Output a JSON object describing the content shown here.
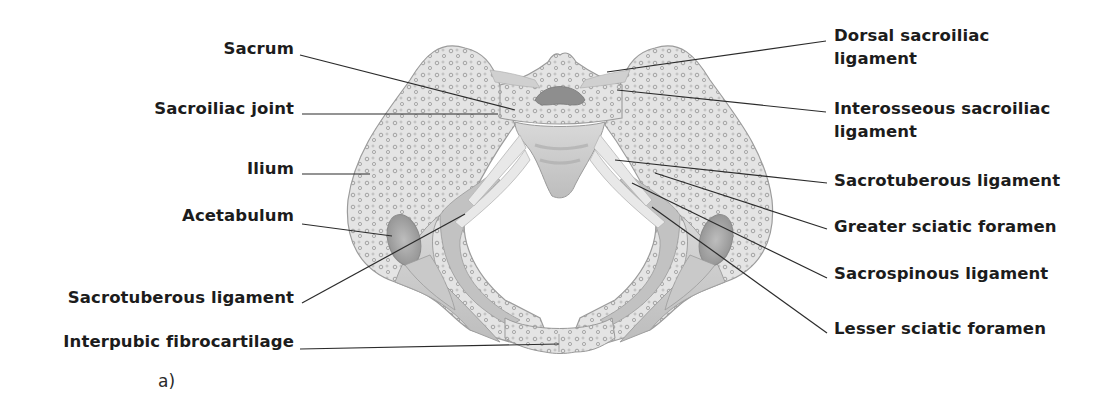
{
  "figure": {
    "panel_label": "a)",
    "colors": {
      "background": "#ffffff",
      "bone_light": "#e2e2e2",
      "bone_mid": "#c4c4c4",
      "bone_dark": "#8e8e8e",
      "ligament": "#d8d8d8",
      "leader_line": "#2b2b2b",
      "text": "#1c1c1c"
    }
  },
  "labels_left": [
    {
      "id": "sacrum",
      "text": "Sacrum",
      "x": 294,
      "y": 37,
      "line": [
        300,
        55,
        515,
        110
      ]
    },
    {
      "id": "sacroiliac-joint",
      "text": "Sacroiliac joint",
      "x": 294,
      "y": 97,
      "line": [
        302,
        114,
        498,
        114
      ]
    },
    {
      "id": "ilium",
      "text": "Ilium",
      "x": 294,
      "y": 157,
      "line": [
        302,
        174,
        370,
        174
      ]
    },
    {
      "id": "acetabulum",
      "text": "Acetabulum",
      "x": 294,
      "y": 204,
      "line": [
        302,
        224,
        392,
        236
      ]
    },
    {
      "id": "sacrotuberous-ligament-left",
      "text": "Sacrotuberous ligament",
      "x": 294,
      "y": 286,
      "line": [
        302,
        303,
        465,
        214
      ]
    },
    {
      "id": "interpubic-fibrocartilage",
      "text": "Interpubic fibrocartilage",
      "x": 294,
      "y": 330,
      "line": [
        300,
        349,
        559,
        344
      ]
    }
  ],
  "labels_right": [
    {
      "id": "dorsal-sacroiliac-ligament",
      "lines": [
        "Dorsal sacroiliac",
        "ligament"
      ],
      "x": 834,
      "y": 24,
      "line": [
        826,
        41,
        607,
        72
      ]
    },
    {
      "id": "interosseous-sacroiliac-ligament",
      "lines": [
        "Interosseous sacroiliac",
        "ligament"
      ],
      "x": 834,
      "y": 97,
      "line": [
        826,
        112,
        617,
        90
      ]
    },
    {
      "id": "sacrotuberous-ligament-right",
      "lines": [
        "Sacrotuberous ligament"
      ],
      "x": 834,
      "y": 169,
      "line": [
        827,
        183,
        615,
        160
      ]
    },
    {
      "id": "greater-sciatic-foramen",
      "lines": [
        "Greater sciatic foramen"
      ],
      "x": 834,
      "y": 215,
      "line": [
        827,
        229,
        655,
        173
      ]
    },
    {
      "id": "sacrospinous-ligament",
      "lines": [
        "Sacrospinous ligament"
      ],
      "x": 834,
      "y": 262,
      "line": [
        827,
        278,
        632,
        183
      ]
    },
    {
      "id": "lesser-sciatic-foramen",
      "lines": [
        "Lesser sciatic foramen"
      ],
      "x": 834,
      "y": 317,
      "line": [
        827,
        333,
        652,
        207
      ]
    }
  ]
}
